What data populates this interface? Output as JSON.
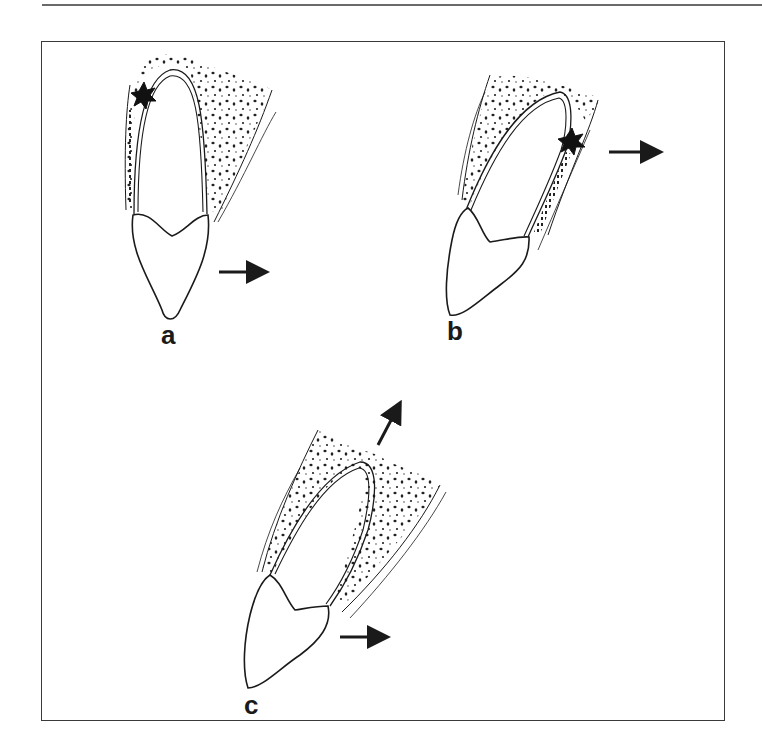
{
  "figure": {
    "panels": [
      {
        "id": "a",
        "label": "a",
        "arrows": [
          "horizontal-right"
        ],
        "marker": "star-apex-left"
      },
      {
        "id": "b",
        "label": "b",
        "arrows": [
          "horizontal-right"
        ],
        "marker": "star-apex-right"
      },
      {
        "id": "c",
        "label": "c",
        "arrows": [
          "horizontal-right",
          "diagonal-up-right"
        ],
        "marker": "none"
      }
    ],
    "colors": {
      "line": "#1a1a1a",
      "frame": "#3a3a3a",
      "background": "#ffffff",
      "bone_dots": "#222222"
    }
  }
}
